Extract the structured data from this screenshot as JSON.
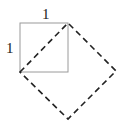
{
  "diagram": {
    "labels": {
      "top_side": "1",
      "left_side": "1"
    },
    "colors": {
      "unit_square_stroke": "#9a9a9a",
      "dashed_square_stroke": "#222222"
    }
  }
}
